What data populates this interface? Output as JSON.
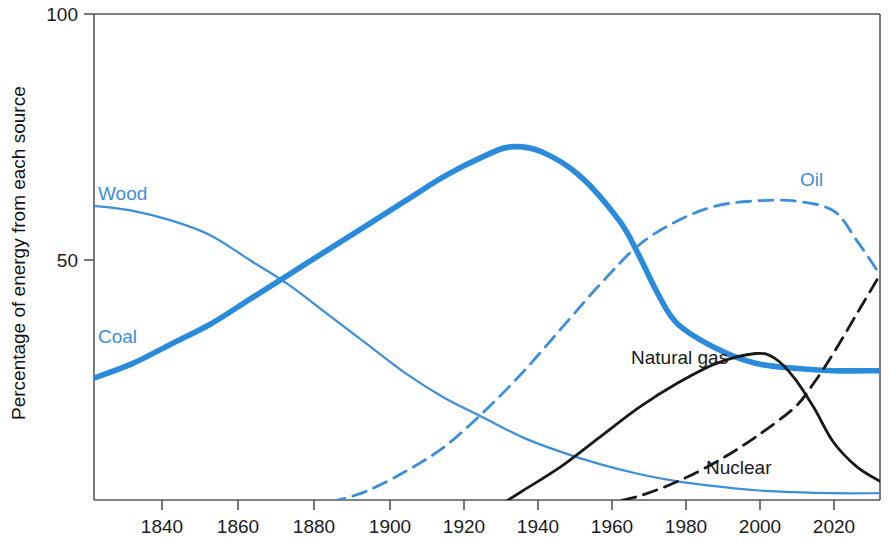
{
  "chart_data": {
    "type": "line",
    "title": "",
    "subtitle": "",
    "xlabel": "",
    "ylabel": "Percentage of energy from each source",
    "xlim": [
      1830,
      2032
    ],
    "ylim": [
      0,
      100
    ],
    "grid": false,
    "legend_position": "inline-labels",
    "xticks": [
      1840,
      1860,
      1880,
      1900,
      1920,
      1940,
      1960,
      1980,
      2000,
      2020
    ],
    "xtick_labels": [
      "1840",
      "1860",
      "1880",
      "1900",
      "1920",
      "1940",
      "1960",
      "1980",
      "2000",
      "2020"
    ],
    "yticks": [
      50,
      100
    ],
    "ytick_labels": [
      "50",
      "100"
    ],
    "series": [
      {
        "name": "Wood",
        "label": "Wood",
        "color": "#3d8edb",
        "style": "solid",
        "width": "thin",
        "x": [
          1830,
          1840,
          1850,
          1860,
          1870,
          1880,
          1890,
          1900,
          1910,
          1920,
          1930,
          1940,
          1950,
          1960,
          1970,
          1980,
          1990,
          2000,
          2010,
          2020,
          2032
        ],
        "values": [
          61,
          60,
          58,
          55,
          50,
          45,
          39,
          33,
          27,
          22,
          18,
          14,
          11,
          8.5,
          6.5,
          5,
          4,
          3.2,
          2.8,
          2.6,
          2.6
        ]
      },
      {
        "name": "Coal",
        "label": "Coal",
        "color": "#2a8bdc",
        "style": "solid",
        "width": "thick",
        "x": [
          1830,
          1840,
          1850,
          1860,
          1870,
          1880,
          1890,
          1900,
          1910,
          1920,
          1930,
          1937,
          1945,
          1955,
          1965,
          1970,
          1975,
          1980,
          1990,
          2000,
          2010,
          2020,
          2032
        ],
        "values": [
          26,
          29,
          33,
          37,
          42,
          47,
          52,
          57,
          62,
          67,
          71,
          73,
          72,
          67,
          58,
          51,
          43,
          37,
          32,
          29,
          28,
          27.5,
          27.5
        ]
      },
      {
        "name": "Oil",
        "label": "Oil",
        "color": "#3d8edb",
        "style": "dashed",
        "width": "medium",
        "x": [
          1891,
          1900,
          1910,
          1920,
          1930,
          1940,
          1950,
          1960,
          1970,
          1980,
          1990,
          2000,
          2010,
          2020,
          2026,
          2032
        ],
        "values": [
          0.8,
          3,
          7,
          12,
          19,
          27,
          36,
          45,
          53,
          58,
          61,
          62,
          62,
          60,
          54,
          47
        ]
      },
      {
        "name": "Natural gas",
        "label": "Natural gas",
        "color": "#18191a",
        "style": "solid",
        "width": "medium",
        "x": [
          1935,
          1940,
          1950,
          1960,
          1970,
          1980,
          1990,
          2000,
          2005,
          2010,
          2015,
          2020,
          2026,
          2032
        ],
        "values": [
          0.5,
          3,
          8,
          14,
          20,
          25,
          29,
          31,
          30,
          26,
          20,
          13,
          8,
          5
        ]
      },
      {
        "name": "Nuclear",
        "label": "Nuclear",
        "color": "#18191a",
        "style": "dashed",
        "width": "medium",
        "x": [
          1960,
          1970,
          1980,
          1990,
          2000,
          2010,
          2015,
          2020,
          2026,
          2032
        ],
        "values": [
          0.3,
          2,
          5,
          9,
          14,
          20,
          25,
          31,
          39,
          47
        ]
      }
    ],
    "annotations": [
      {
        "text": "Wood",
        "x": 1843,
        "y": 67,
        "color": "#3d8edb"
      },
      {
        "text": "Coal",
        "x": 1843,
        "y": 33,
        "color": "#3d8edb"
      },
      {
        "text": "Oil",
        "x": 2002,
        "y": 66,
        "color": "#3d8edb"
      },
      {
        "text": "Natural gas",
        "x": 1965,
        "y": 35,
        "color": "#18191a"
      },
      {
        "text": "Nuclear",
        "x": 1992,
        "y": 11,
        "color": "#18191a"
      }
    ]
  },
  "axis": {
    "ylabel": "Percentage of energy from each source",
    "ytick_top": "100",
    "ytick_mid": "50",
    "xticks": [
      "1840",
      "1860",
      "1880",
      "1900",
      "1920",
      "1940",
      "1960",
      "1980",
      "2000",
      "2020"
    ]
  },
  "labels": {
    "wood": "Wood",
    "coal": "Coal",
    "oil": "Oil",
    "natural_gas": "Natural gas",
    "nuclear": "Nuclear"
  },
  "colors": {
    "series_blue": "#3d8edb",
    "coal_blue": "#2a8bdc",
    "series_black": "#18191a",
    "axis": "#55585a",
    "background": "#ffffff"
  },
  "caption": ""
}
